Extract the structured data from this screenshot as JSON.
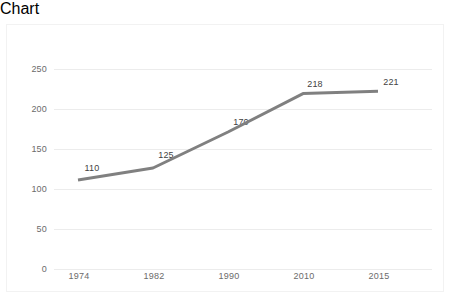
{
  "chart_data": {
    "type": "line",
    "title": "",
    "subtitle": "",
    "xlabel": "",
    "ylabel": "",
    "categories": [
      "1974",
      "1982",
      "1990",
      "2010",
      "2015"
    ],
    "values": [
      110,
      125,
      170,
      218,
      221
    ],
    "point_labels": [
      "110",
      "125",
      "170",
      "218",
      "221"
    ],
    "ylim": [
      0,
      250
    ],
    "yticks": [
      0,
      50,
      100,
      150,
      200,
      250
    ],
    "ytick_labels": [
      "0",
      "50",
      "100",
      "150",
      "200",
      "250"
    ],
    "grid": "horizontal",
    "legend": "none",
    "series": [
      {
        "name": "",
        "values": [
          110,
          125,
          170,
          218,
          221
        ],
        "color": "#808080"
      }
    ],
    "colors": {
      "line": "#808080",
      "grid": "#ececec",
      "axis_text": "#6b6b6b",
      "label_text": "#3f3f3f",
      "background": "#ffffff",
      "border": "#f2f2f2"
    }
  }
}
